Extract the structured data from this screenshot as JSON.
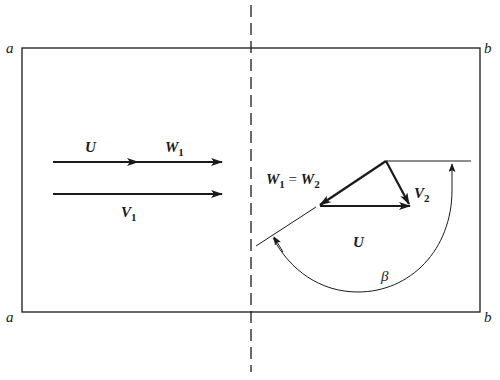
{
  "figure": {
    "corners": {
      "top_left": "a",
      "top_right": "b",
      "bottom_left": "a",
      "bottom_right": "b"
    },
    "inlet_labels": {
      "u": "U",
      "w1_main": "W",
      "w1_sub": "1",
      "v1_main": "V",
      "v1_sub": "1"
    },
    "outlet_labels": {
      "w_eq_lhs_main": "W",
      "w_eq_lhs_sub": "1",
      "w_eq_sign": " = ",
      "w_eq_rhs_main": "W",
      "w_eq_rhs_sub": "2",
      "v2_main": "V",
      "v2_sub": "2",
      "u": "U",
      "angle": "β"
    },
    "colors": {
      "stroke": "#1a1a1a",
      "background": "#ffffff"
    }
  }
}
